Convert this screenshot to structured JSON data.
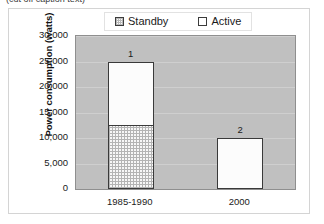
{
  "caption": {
    "text": "(cut off caption text)"
  },
  "chart_data": {
    "type": "bar",
    "subtype": "stacked-column",
    "title": "",
    "xlabel": "",
    "ylabel": "Power consumption (watts)",
    "categories": [
      "1985-1990",
      "2000"
    ],
    "ylim": [
      0,
      30000
    ],
    "yticks": [
      0,
      5000,
      10000,
      15000,
      20000,
      25000,
      30000
    ],
    "ytick_labels": [
      "0",
      "5,000",
      "10,000",
      "15,000",
      "20,000",
      "25,000",
      "30,000"
    ],
    "grid": true,
    "legend_position": "top-center",
    "legend": [
      "Standby",
      "Active"
    ],
    "series": [
      {
        "name": "Standby",
        "values": [
          12500,
          0
        ]
      },
      {
        "name": "Active",
        "values": [
          12500,
          10000
        ]
      }
    ],
    "totals": [
      25000,
      10000
    ],
    "data_labels": [
      "1",
      "2"
    ],
    "colors": {
      "plot_background": "#c0c0c0",
      "gridline": "#cfcfcf",
      "bar_outline": "#3a3a3a",
      "standby_fill": "#f7f7f7",
      "active_fill": "#fcfcfc",
      "frame_border": "#d4d4d4"
    }
  }
}
